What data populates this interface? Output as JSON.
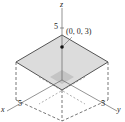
{
  "diagram": {
    "type": "3d-plane-region",
    "axes": {
      "x": {
        "label": "x",
        "tick_label": "5"
      },
      "y": {
        "label": "y",
        "tick_label": "5"
      },
      "z": {
        "label": "z",
        "tick_label": "5"
      }
    },
    "point": {
      "label": "(0, 0, 3)"
    },
    "colors": {
      "plane_fill": "#d9d9d9",
      "edge": "#444444",
      "inner_fill": "#bdbdbd"
    }
  }
}
